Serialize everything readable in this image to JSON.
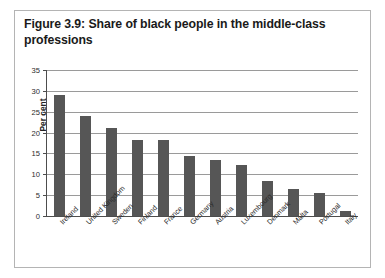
{
  "figure": {
    "title": "Figure 3.9: Share of black people in the middle-class professions"
  },
  "colors": {
    "bar": "#565656",
    "gridline": "#9a9a9a",
    "axis": "#4d4d4d",
    "border": "#b4b4b4",
    "background": "#ffffff",
    "text": "#1a1a1a"
  },
  "chart_data": {
    "type": "bar",
    "title": "Figure 3.9: Share of black people in the middle-class professions",
    "xlabel": "",
    "ylabel": "Per cent",
    "ylim": [
      0,
      35
    ],
    "yticks": [
      0,
      5,
      10,
      15,
      20,
      25,
      30,
      35
    ],
    "ytick_labels": [
      "0",
      "5",
      "10",
      "15",
      "20",
      "25",
      "30",
      "35"
    ],
    "grid": true,
    "legend": false,
    "categories": [
      "Ireland",
      "United Kingdom",
      "Sweden",
      "Finland",
      "France",
      "Germany",
      "Austria",
      "Luxembourg",
      "Denmark",
      "Malta",
      "Portugal",
      "Italy"
    ],
    "values": [
      29,
      24,
      21,
      18.2,
      18.2,
      14.5,
      13.5,
      12.2,
      8.5,
      6.5,
      5.5,
      1.3
    ]
  }
}
